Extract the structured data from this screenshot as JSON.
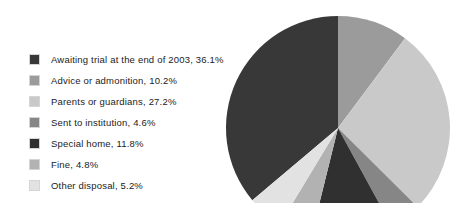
{
  "chart_data": {
    "type": "pie",
    "title": "",
    "subtitle": "",
    "xlabel": "",
    "ylabel": "",
    "legend_position": "left",
    "grid": false,
    "units": "percent",
    "start_angle_deg": 0,
    "direction": "counter-clockwise-first-slice",
    "categories": [
      "Awaiting trial at the end of 2003",
      "Advice or admonition",
      "Parents or guardians",
      "Sent to institution",
      "Special home",
      "Fine",
      "Other disposal"
    ],
    "values": [
      36.1,
      10.2,
      27.2,
      4.6,
      11.8,
      4.8,
      5.2
    ],
    "colors": [
      "#383838",
      "#9b9b9b",
      "#c9c9c9",
      "#868686",
      "#303030",
      "#b2b2b2",
      "#e2e2e2"
    ],
    "slices": [
      {
        "label": "Awaiting trial at the end of 2003",
        "value": 36.1,
        "color": "#383838"
      },
      {
        "label": "Advice or admonition",
        "value": 10.2,
        "color": "#9b9b9b"
      },
      {
        "label": "Parents or guardians",
        "value": 27.2,
        "color": "#c9c9c9"
      },
      {
        "label": "Sent to institution",
        "value": 4.6,
        "color": "#868686"
      },
      {
        "label": "Special home",
        "value": 11.8,
        "color": "#303030"
      },
      {
        "label": "Fine",
        "value": 4.8,
        "color": "#b2b2b2"
      },
      {
        "label": "Other disposal",
        "value": 5.2,
        "color": "#e2e2e2"
      }
    ]
  },
  "legend": {
    "items": [
      {
        "swatch_color": "#383838",
        "text": "Awaiting trial at the end of 2003, 36.1%"
      },
      {
        "swatch_color": "#9b9b9b",
        "text": "Advice or admonition, 10.2%"
      },
      {
        "swatch_color": "#c9c9c9",
        "text": "Parents or guardians, 27.2%"
      },
      {
        "swatch_color": "#868686",
        "text": "Sent to institution, 4.6%"
      },
      {
        "swatch_color": "#303030",
        "text": "Special home, 11.8%"
      },
      {
        "swatch_color": "#b2b2b2",
        "text": "Fine, 4.8%"
      },
      {
        "swatch_color": "#e2e2e2",
        "text": "Other disposal, 5.2%"
      }
    ]
  },
  "pie_geometry": {
    "center_x": 338,
    "center_y": 128,
    "radius": 112
  },
  "background_color": "#ffffff"
}
